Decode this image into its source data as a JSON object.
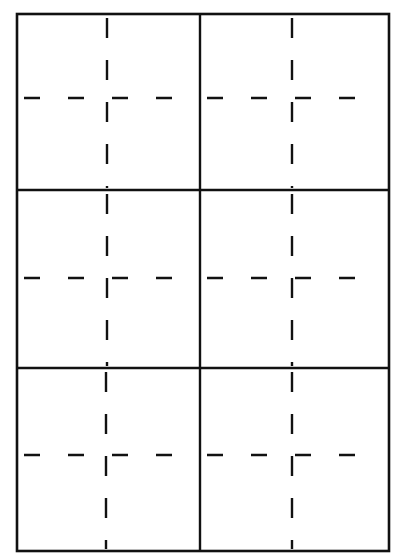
{
  "diagram": {
    "type": "practice-grid",
    "rows": 3,
    "cols": 2,
    "colors": {
      "line": "#111111",
      "background": "#ffffff"
    },
    "outer": {
      "x0": 17,
      "y0": 14,
      "x1": 389,
      "y1": 551
    },
    "col_dividers": [
      200
    ],
    "row_dividers": [
      190,
      368
    ],
    "cells": [
      {
        "row": 0,
        "col": 0,
        "cx": 107,
        "cy": 98
      },
      {
        "row": 0,
        "col": 1,
        "cx": 292,
        "cy": 98
      },
      {
        "row": 1,
        "col": 0,
        "cx": 107,
        "cy": 278
      },
      {
        "row": 1,
        "col": 1,
        "cx": 292,
        "cy": 278
      },
      {
        "row": 2,
        "col": 0,
        "cx": 106,
        "cy": 455
      },
      {
        "row": 2,
        "col": 1,
        "cx": 292,
        "cy": 455
      }
    ]
  }
}
